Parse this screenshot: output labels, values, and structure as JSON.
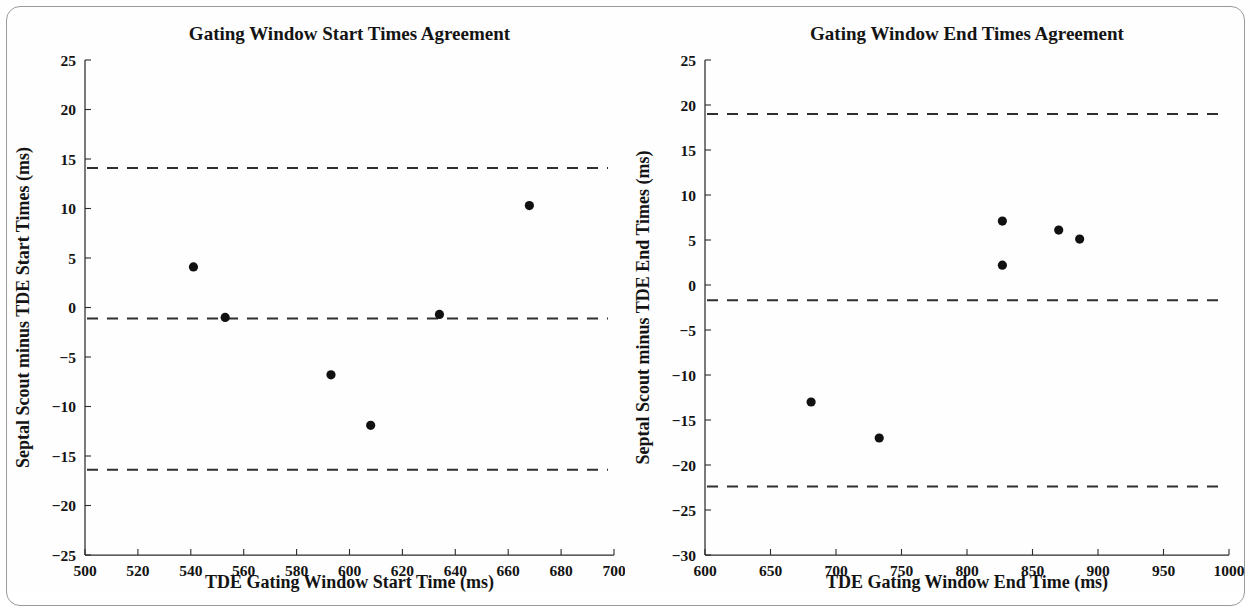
{
  "figure": {
    "background": "#fefefe",
    "marker_color": "#111111",
    "line_color": "#2f2f2f",
    "axis_color": "#2b2b2b"
  },
  "chart_data": [
    {
      "type": "scatter",
      "panel": "left",
      "title": "Gating Window Start Times Agreement",
      "xlabel": "TDE Gating Window Start Time (ms)",
      "ylabel": "Septal Scout minus TDE Start Times (ms)",
      "xlim": [
        500,
        700
      ],
      "ylim": [
        -25,
        25
      ],
      "xticks": [
        500,
        520,
        540,
        560,
        580,
        600,
        620,
        640,
        660,
        680,
        700
      ],
      "xtick_labels": [
        "500",
        "520",
        "540",
        "560",
        "580",
        "600",
        "620",
        "640",
        "660",
        "680",
        "700"
      ],
      "yticks": [
        25,
        20,
        15,
        10,
        5,
        0,
        -5,
        -10,
        -15,
        -20,
        -25
      ],
      "ytick_labels": [
        "25",
        "20",
        "15",
        "10",
        "5",
        "0",
        "−5",
        "−10",
        "−15",
        "−20",
        "−25"
      ],
      "grid": false,
      "legend": "none",
      "x": [
        541,
        553,
        593,
        608,
        634,
        668
      ],
      "y": [
        4.1,
        -1.0,
        -6.8,
        -11.9,
        -0.7,
        10.3
      ],
      "reference_lines": [
        {
          "name": "upper-limit-of-agreement",
          "value": 14.1,
          "style": "dashed"
        },
        {
          "name": "bias-mean-difference",
          "value": -1.1,
          "style": "dashed"
        },
        {
          "name": "lower-limit-of-agreement",
          "value": -16.4,
          "style": "dashed"
        }
      ]
    },
    {
      "type": "scatter",
      "panel": "right",
      "title": "Gating Window End Times Agreement",
      "xlabel": "TDE Gating Window End Time (ms)",
      "ylabel": "Septal Scout minus TDE End Times (ms)",
      "xlim": [
        600,
        1000
      ],
      "ylim": [
        -30,
        25
      ],
      "xticks": [
        600,
        650,
        700,
        750,
        800,
        850,
        900,
        950,
        1000
      ],
      "xtick_labels": [
        "600",
        "650",
        "700",
        "750",
        "800",
        "850",
        "900",
        "950",
        "1000"
      ],
      "yticks": [
        25,
        20,
        15,
        10,
        5,
        0,
        -5,
        -10,
        -15,
        -20,
        -25,
        -30
      ],
      "ytick_labels": [
        "25",
        "20",
        "15",
        "10",
        "5",
        "0",
        "−5",
        "−10",
        "−15",
        "−20",
        "−25",
        "−30"
      ],
      "grid": false,
      "legend": "none",
      "x": [
        681,
        733,
        827,
        827,
        870,
        886
      ],
      "y": [
        -13.0,
        -17.0,
        7.1,
        2.2,
        6.1,
        5.1
      ],
      "reference_lines": [
        {
          "name": "upper-limit-of-agreement",
          "value": 19.0,
          "style": "dashed"
        },
        {
          "name": "bias-mean-difference",
          "value": -1.7,
          "style": "dashed"
        },
        {
          "name": "lower-limit-of-agreement",
          "value": -22.4,
          "style": "dashed"
        }
      ]
    }
  ]
}
